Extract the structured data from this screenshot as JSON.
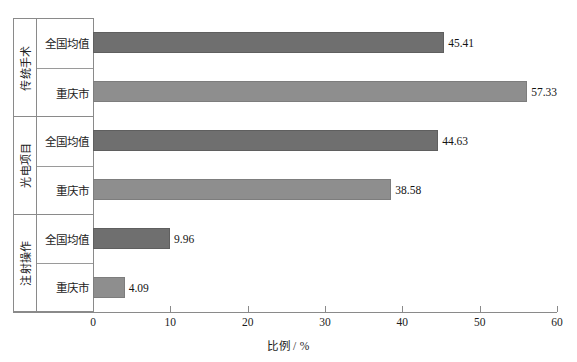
{
  "chart_data": {
    "type": "bar",
    "orientation": "horizontal",
    "title": "",
    "xlabel": "比例 / %",
    "ylabel": "",
    "xlim": [
      0,
      60
    ],
    "xticks": [
      0,
      10,
      20,
      30,
      40,
      50,
      60
    ],
    "xtick_labels": [
      "0",
      "10",
      "20",
      "30",
      "40",
      "50",
      "60"
    ],
    "grid": false,
    "legend": "none",
    "categories": [
      "全国均值",
      "重庆市"
    ],
    "groups": [
      {
        "label": "传统手术",
        "bars": [
          {
            "category": "全国均值",
            "value": 45.41,
            "label": "45.41",
            "series": "national"
          },
          {
            "category": "重庆市",
            "value": 57.33,
            "label": "57.33",
            "series": "chongqing"
          }
        ]
      },
      {
        "label": "光电项目",
        "bars": [
          {
            "category": "全国均值",
            "value": 44.63,
            "label": "44.63",
            "series": "national"
          },
          {
            "category": "重庆市",
            "value": 38.58,
            "label": "38.58",
            "series": "chongqing"
          }
        ]
      },
      {
        "label": "注射操作",
        "bars": [
          {
            "category": "全国均值",
            "value": 9.96,
            "label": "9.96",
            "series": "national"
          },
          {
            "category": "重庆市",
            "value": 4.09,
            "label": "4.09",
            "series": "chongqing"
          }
        ]
      }
    ],
    "colors": {
      "bar_national": "#6f6f6f",
      "bar_chongqing": "#8e8e8e",
      "axis": "#8a8a8a",
      "text": "#1c1c1c",
      "background": "#ffffff"
    }
  }
}
